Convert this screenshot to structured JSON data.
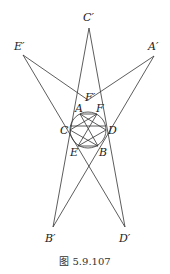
{
  "figure": {
    "caption": "图 5.9.107",
    "labels": {
      "C_prime": "C′",
      "E_prime": "E′",
      "A_prime": "A′",
      "F_prime": "F′",
      "A": "A",
      "F": "F",
      "C": "C",
      "D": "D",
      "E": "E",
      "B": "B",
      "B_prime": "B′",
      "D_prime": "D′"
    },
    "points": {
      "C_prime": [
        89,
        28
      ],
      "E_prime": [
        23,
        55
      ],
      "A_prime": [
        154,
        56
      ],
      "F_prime": [
        88,
        100
      ],
      "B_prime": [
        53,
        227
      ],
      "D_prime": [
        125,
        227
      ],
      "A": [
        80,
        114
      ],
      "F": [
        97,
        114
      ],
      "C": [
        70,
        130
      ],
      "D": [
        106,
        130
      ],
      "E": [
        78,
        146
      ],
      "B": [
        98,
        146
      ]
    },
    "circle": {
      "center": [
        88,
        130
      ],
      "radius": 18
    }
  }
}
